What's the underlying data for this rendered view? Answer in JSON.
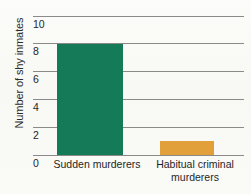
{
  "chart_data": {
    "type": "bar",
    "title": "",
    "subtitle": "",
    "xlabel": "",
    "ylabel": "Number of shy inmates",
    "categories": [
      "Sudden murderers",
      "Habitual criminal murderers"
    ],
    "values": [
      8,
      1
    ],
    "ylim": [
      0,
      10
    ],
    "yticks": [
      0,
      2,
      4,
      6,
      8,
      10
    ],
    "ytick_labels": [
      "0",
      "2",
      "4",
      "6",
      "8",
      "10"
    ],
    "grid": true,
    "legend": false,
    "legend_position": "none",
    "bar_colors": [
      "#157a58",
      "#e2a03b"
    ],
    "series": [
      {
        "name": "Number of shy inmates",
        "values": [
          8,
          1
        ]
      }
    ]
  },
  "axis": {
    "y_title": "Number of shy inmates",
    "ticks": [
      {
        "label": "10",
        "value": 10
      },
      {
        "label": "8",
        "value": 8
      },
      {
        "label": "6",
        "value": 6
      },
      {
        "label": "4",
        "value": 4
      },
      {
        "label": "2",
        "value": 2
      },
      {
        "label": "0",
        "value": 0
      }
    ]
  },
  "bars": [
    {
      "label_line1": "Sudden murderers",
      "label_line2": "",
      "value": 8,
      "color": "#157a58"
    },
    {
      "label_line1": "Habitual criminal",
      "label_line2": "murderers",
      "value": 1,
      "color": "#e2a03b"
    }
  ],
  "colors": {
    "grid": "#8a8a8a",
    "background": "#fbfbf8",
    "text": "#1f1f1f",
    "bar_green": "#157a58",
    "bar_orange": "#e2a03b"
  }
}
